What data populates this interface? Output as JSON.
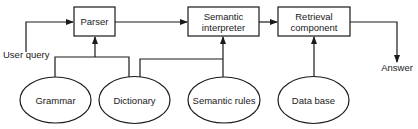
{
  "diagram": {
    "colors": {
      "stroke": "#1a1a1a",
      "background": "#ffffff",
      "text": "#1a1a1a"
    },
    "boxes": [
      {
        "id": "parser",
        "line1": "Parser",
        "line2": ""
      },
      {
        "id": "semantic-interpreter",
        "line1": "Semantic",
        "line2": "interpreter"
      },
      {
        "id": "retrieval-component",
        "line1": "Retrieval",
        "line2": "component"
      }
    ],
    "ellipses": [
      {
        "id": "grammar",
        "label": "Grammar"
      },
      {
        "id": "dictionary",
        "label": "Dictionary"
      },
      {
        "id": "semantic-rules",
        "label": "Semantic rules"
      },
      {
        "id": "data-base",
        "label": "Data base"
      }
    ],
    "io": {
      "input_label": "User query",
      "output_label": "Answer"
    }
  }
}
